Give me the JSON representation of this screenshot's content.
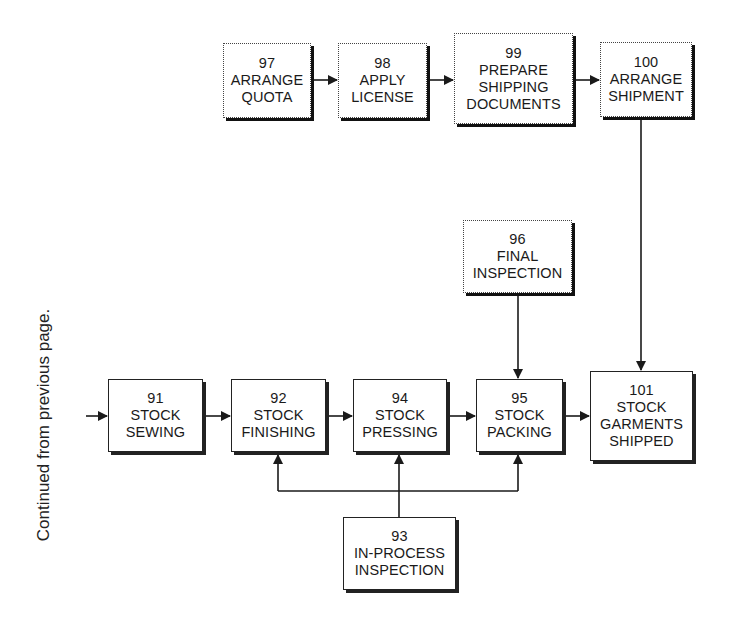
{
  "side_note": "Continued from previous page.",
  "boxes": {
    "b97": {
      "num": "97",
      "line1": "ARRANGE",
      "line2": "QUOTA",
      "line3": ""
    },
    "b98": {
      "num": "98",
      "line1": "APPLY",
      "line2": "LICENSE",
      "line3": ""
    },
    "b99": {
      "num": "99",
      "line1": "PREPARE",
      "line2": "SHIPPING",
      "line3": "DOCUMENTS"
    },
    "b100": {
      "num": "100",
      "line1": "ARRANGE",
      "line2": "SHIPMENT",
      "line3": ""
    },
    "b96": {
      "num": "96",
      "line1": "FINAL",
      "line2": "INSPECTION",
      "line3": ""
    },
    "b91": {
      "num": "91",
      "line1": "STOCK",
      "line2": "SEWING",
      "line3": ""
    },
    "b92": {
      "num": "92",
      "line1": "STOCK",
      "line2": "FINISHING",
      "line3": ""
    },
    "b94": {
      "num": "94",
      "line1": "STOCK",
      "line2": "PRESSING",
      "line3": ""
    },
    "b95": {
      "num": "95",
      "line1": "STOCK",
      "line2": "PACKING",
      "line3": ""
    },
    "b101": {
      "num": "101",
      "line1": "STOCK",
      "line2": "GARMENTS",
      "line3": "SHIPPED"
    },
    "b93": {
      "num": "93",
      "line1": "IN-PROCESS",
      "line2": "INSPECTION",
      "line3": ""
    }
  },
  "connections": [
    {
      "from": "external",
      "to": "91"
    },
    {
      "from": "91",
      "to": "92"
    },
    {
      "from": "92",
      "to": "94"
    },
    {
      "from": "94",
      "to": "95"
    },
    {
      "from": "95",
      "to": "101"
    },
    {
      "from": "97",
      "to": "98"
    },
    {
      "from": "98",
      "to": "99"
    },
    {
      "from": "99",
      "to": "100"
    },
    {
      "from": "100",
      "to": "101"
    },
    {
      "from": "96",
      "to": "95"
    },
    {
      "from": "93",
      "to": "92"
    },
    {
      "from": "93",
      "to": "94"
    },
    {
      "from": "93",
      "to": "95"
    }
  ],
  "colors": {
    "line": "#1a1a1a",
    "background": "#ffffff"
  }
}
